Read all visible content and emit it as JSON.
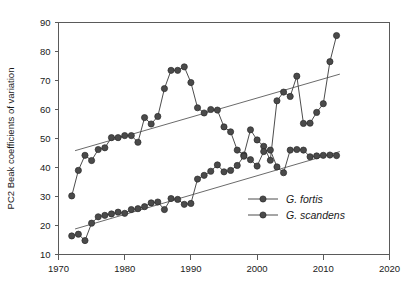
{
  "chart_data": {
    "type": "line",
    "title": "",
    "xlabel": "",
    "ylabel": "PC2  Beak coefficients of variation",
    "xlim": [
      1970,
      2020
    ],
    "ylim": [
      10,
      90
    ],
    "xticks": [
      1970,
      1980,
      1990,
      2000,
      2010,
      2020
    ],
    "yticks": [
      10,
      20,
      30,
      40,
      50,
      60,
      70,
      80,
      90
    ],
    "grid": false,
    "legend_position": "lower-right",
    "series": [
      {
        "name": "G. fortis",
        "marker": "filled-circle",
        "color": "#4a4a4a",
        "x": [
          1972,
          1973,
          1974,
          1975,
          1976,
          1977,
          1978,
          1979,
          1980,
          1981,
          1982,
          1983,
          1984,
          1985,
          1986,
          1987,
          1988,
          1989,
          1990,
          1991,
          1992,
          1993,
          1994,
          1995,
          1996,
          1997,
          1998,
          1999,
          2000,
          2001,
          2002,
          2003,
          2004,
          2005,
          2006,
          2007,
          2008,
          2009,
          2010,
          2011,
          2012
        ],
        "y": [
          30.2,
          39.0,
          44.2,
          42.4,
          46.2,
          46.8,
          50.3,
          50.3,
          51.0,
          51.0,
          48.7,
          57.2,
          55.0,
          57.6,
          67.2,
          73.5,
          73.5,
          74.7,
          69.3,
          60.6,
          58.8,
          60.0,
          59.8,
          54.0,
          52.3,
          46.0,
          44.3,
          53.0,
          49.5,
          47.3,
          42.5,
          63.0,
          66.0,
          64.5,
          71.5,
          55.2,
          55.3,
          59.0,
          62.0,
          76.5,
          85.5
        ]
      },
      {
        "name": "G. scandens",
        "marker": "filled-circle",
        "color": "#4a4a4a",
        "x": [
          1972,
          1973,
          1974,
          1975,
          1976,
          1977,
          1978,
          1979,
          1980,
          1981,
          1982,
          1983,
          1984,
          1985,
          1986,
          1987,
          1988,
          1989,
          1990,
          1991,
          1992,
          1993,
          1994,
          1995,
          1996,
          1997,
          1998,
          1999,
          2000,
          2001,
          2002,
          2003,
          2004,
          2005,
          2006,
          2007,
          2008,
          2009,
          2010,
          2011,
          2012
        ],
        "y": [
          16.4,
          17.0,
          14.8,
          20.8,
          23.0,
          23.5,
          24.0,
          24.6,
          24.2,
          25.5,
          25.8,
          26.5,
          27.8,
          28.1,
          25.5,
          29.3,
          29.0,
          27.3,
          27.6,
          36.0,
          37.3,
          38.7,
          40.9,
          38.5,
          39.0,
          40.7,
          43.9,
          42.7,
          40.5,
          45.5,
          46.0,
          40.2,
          38.2,
          46.0,
          46.2,
          46.0,
          43.7,
          44.0,
          44.2,
          44.3,
          44.1
        ]
      }
    ],
    "trendlines": [
      {
        "for": "G. fortis",
        "x1": 1972.5,
        "y1": 45.8,
        "x2": 2012.5,
        "y2": 72.2
      },
      {
        "for": "G. scandens",
        "x1": 1972.5,
        "y1": 18.8,
        "x2": 2012.5,
        "y2": 45.5
      }
    ]
  },
  "legend": {
    "items": [
      {
        "label": "G. fortis"
      },
      {
        "label": "G. scandens"
      }
    ]
  }
}
